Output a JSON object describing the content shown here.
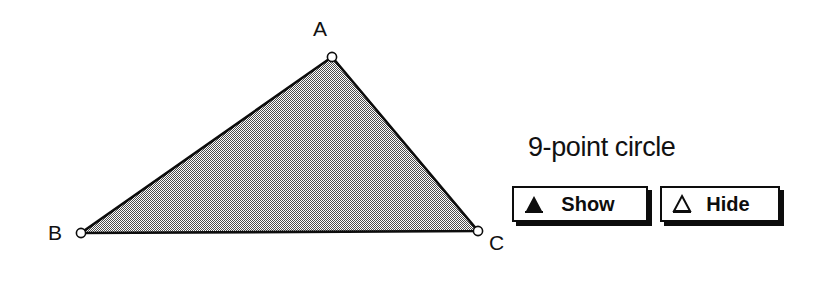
{
  "canvas": {
    "background_color": "#ffffff",
    "stroke_color": "#0d0d0d",
    "fill_color": "#a8a8a8",
    "fill_style": "50% dither checkerboard",
    "triangle": {
      "name": "triangle-ABC",
      "vertices": [
        {
          "label": "A",
          "x": 332,
          "y": 57
        },
        {
          "label": "B",
          "x": 81,
          "y": 233
        },
        {
          "label": "C",
          "x": 478,
          "y": 231
        }
      ],
      "handle_radius": 4.5,
      "handle_fill": "#ffffff",
      "stroke_width": 2.5
    },
    "labels": {
      "a": "A",
      "b": "B",
      "c": "C"
    }
  },
  "panel": {
    "title": "9-point circle",
    "buttons": [
      {
        "label": "Show",
        "icon": "filled-triangle-icon",
        "icon_style": "solid"
      },
      {
        "label": "Hide",
        "icon": "outline-triangle-icon",
        "icon_style": "outline"
      }
    ]
  }
}
